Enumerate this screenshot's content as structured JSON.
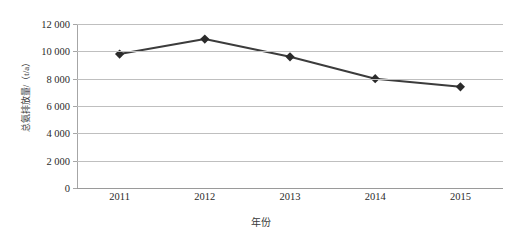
{
  "chart_data": {
    "type": "line",
    "title": "",
    "xlabel": "年份",
    "ylabel": "总氨排放量/（t/a）",
    "categories": [
      "2011",
      "2012",
      "2013",
      "2014",
      "2015"
    ],
    "series": [
      {
        "name": "总氨排放量",
        "values": [
          9800,
          10900,
          9600,
          8000,
          7400
        ]
      }
    ],
    "ylim": [
      0,
      12000
    ],
    "y_ticks": [
      "0",
      "2 000",
      "4 000",
      "6 000",
      "8 000",
      "10 000",
      "12 000"
    ],
    "y_tick_values": [
      0,
      2000,
      4000,
      6000,
      8000,
      10000,
      12000
    ],
    "grid": true,
    "legend": "none",
    "colors": {
      "line": "#3c3c3c",
      "marker": "#2b2b2b",
      "gridline": "#bfbfbf",
      "axis": "#9a9a9a",
      "text": "#2b2b2b",
      "background": "#ffffff"
    },
    "marker_shape": "diamond",
    "line_width": 2
  }
}
